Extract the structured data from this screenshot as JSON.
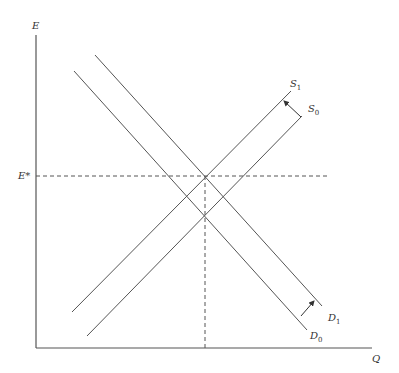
{
  "diagram": {
    "type": "supply-demand",
    "axes": {
      "y_label": "E",
      "x_label": "Q"
    },
    "equilibrium_label": "E*",
    "curves": [
      {
        "name": "S",
        "sub": "0",
        "kind": "supply"
      },
      {
        "name": "S",
        "sub": "1",
        "kind": "supply"
      },
      {
        "name": "D",
        "sub": "0",
        "kind": "demand"
      },
      {
        "name": "D",
        "sub": "1",
        "kind": "demand"
      }
    ],
    "shifts": [
      {
        "from": "S0",
        "to": "S1",
        "direction": "up-left"
      },
      {
        "from": "D0",
        "to": "D1",
        "direction": "up-right"
      }
    ],
    "colors": {
      "line": "#555555",
      "background": "#ffffff"
    }
  }
}
